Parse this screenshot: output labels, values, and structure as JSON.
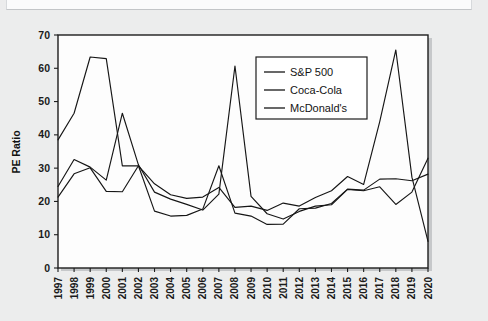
{
  "figure": {
    "kind": "scanned-line-chart",
    "background_color": "#ececed",
    "plot_background_color": "#fdfdfd",
    "line_color": "#161616"
  },
  "chart_data": {
    "type": "line",
    "title": "",
    "xlabel": "",
    "ylabel": "PE Ratio",
    "ylim": [
      0,
      70
    ],
    "ytick_step": 10,
    "yticks": [
      "0",
      "10",
      "20",
      "30",
      "40",
      "50",
      "60",
      "70"
    ],
    "grid": false,
    "legend_position": "upper-right-inside",
    "categories": [
      "1997",
      "1998",
      "1999",
      "2000",
      "2001",
      "2002",
      "2003",
      "2004",
      "2005",
      "2006",
      "2007",
      "2008",
      "2009",
      "2010",
      "2011",
      "2012",
      "2013",
      "2014",
      "2015",
      "2016",
      "2017",
      "2018",
      "2019",
      "2020"
    ],
    "series": [
      {
        "name": "S&P 500",
        "values": [
          24.5,
          32.6,
          30.3,
          26.4,
          46.5,
          31.0,
          22.8,
          20.7,
          19.1,
          17.4,
          22.2,
          60.7,
          21.5,
          16.3,
          14.7,
          17.0,
          18.6,
          19.0,
          23.6,
          23.2,
          24.4,
          19.1,
          22.8,
          33.0
        ]
      },
      {
        "name": "Coca-Cola",
        "values": [
          38.5,
          46.5,
          63.4,
          62.9,
          30.7,
          30.7,
          25.3,
          22.0,
          20.9,
          21.3,
          24.2,
          18.2,
          18.6,
          17.3,
          19.5,
          18.6,
          21.2,
          23.2,
          27.5,
          25.1,
          44.0,
          65.5,
          27.3,
          8.0
        ]
      },
      {
        "name": "McDonald's",
        "values": [
          21.3,
          28.3,
          30.1,
          23.0,
          22.9,
          30.7,
          17.1,
          15.6,
          15.8,
          17.7,
          30.7,
          16.5,
          15.6,
          13.1,
          13.2,
          17.8,
          18.0,
          19.4,
          23.7,
          23.4,
          26.7,
          26.8,
          26.2,
          28.2
        ]
      }
    ]
  },
  "legend": {
    "entries": [
      {
        "label": "S&P 500"
      },
      {
        "label": "Coca-Cola"
      },
      {
        "label": "McDonald's"
      }
    ]
  },
  "axis": {
    "y_title": "PE Ratio"
  }
}
